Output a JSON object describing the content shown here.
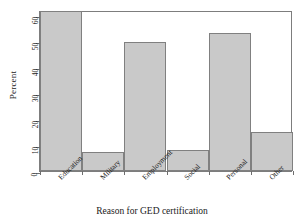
{
  "chart_data": {
    "type": "bar",
    "title": "",
    "subtitle": "",
    "xlabel": "Reason for GED certification",
    "ylabel": "Percent",
    "categories": [
      "Education",
      "Military",
      "Employment",
      "Social",
      "Personal",
      "Other"
    ],
    "values": [
      61.5,
      7.5,
      49.5,
      8,
      53,
      15
    ],
    "series": [
      {
        "name": "Percent",
        "values": [
          61.5,
          7.5,
          49.5,
          8,
          53,
          15
        ]
      }
    ],
    "ylim": [
      0,
      62
    ],
    "yticks": [
      0,
      10,
      20,
      30,
      40,
      50,
      60
    ],
    "ytick_labels": [
      "0",
      "10",
      "20",
      "30",
      "40",
      "50",
      "60"
    ],
    "grid": false,
    "legend": false,
    "legend_position": "none",
    "bar_fill_color": "#c9c9c9",
    "bar_edge_color": "#808080",
    "axis_color": "#6e6e6e",
    "background_color": "#ffffff"
  }
}
